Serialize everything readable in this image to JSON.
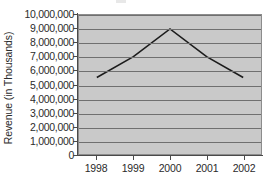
{
  "chart_data": {
    "type": "line",
    "title": "",
    "xlabel": "",
    "ylabel": "Revenue (in Thousands)",
    "categories": [
      "1998",
      "1999",
      "2000",
      "2001",
      "2002"
    ],
    "values": [
      5500000,
      7000000,
      9000000,
      7000000,
      5500000
    ],
    "series": [
      {
        "name": "Revenue",
        "values": [
          5500000,
          7000000,
          9000000,
          7000000,
          5500000
        ]
      }
    ],
    "ylim": [
      0,
      10000000
    ],
    "ytick_labels": [
      "10,000,000",
      "9,000,000",
      "8,000,000",
      "7,000,000",
      "6,000,000",
      "5,000,000",
      "4,000,000",
      "3,000,000",
      "2,000,000",
      "1,000,000",
      "0"
    ],
    "ytick_values": [
      10000000,
      9000000,
      8000000,
      7000000,
      6000000,
      5000000,
      4000000,
      3000000,
      2000000,
      1000000,
      0
    ],
    "grid": true,
    "legend": false,
    "legend_position": "none",
    "colors": {
      "plot_background": "#c9c9c9",
      "gridline": "#6f6f6f",
      "axis": "#4a4a4a",
      "series_line": "#1c1c1c",
      "text": "#2b2b2b",
      "page_background": "#ffffff"
    }
  }
}
